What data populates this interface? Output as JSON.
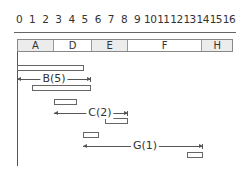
{
  "axis": {
    "ticks": [
      "0",
      "1",
      "2",
      "3",
      "4",
      "5",
      "6",
      "7",
      "8",
      "9",
      "10",
      "11",
      "12",
      "13",
      "14",
      "15",
      "16"
    ]
  },
  "header": {
    "cells": [
      {
        "label": "A",
        "x": 17,
        "w": 36,
        "shaded": true
      },
      {
        "label": "D",
        "x": 53,
        "w": 39,
        "shaded": false
      },
      {
        "label": "E",
        "x": 92,
        "w": 36,
        "shaded": true
      },
      {
        "label": "F",
        "x": 128,
        "w": 75,
        "shaded": false
      },
      {
        "label": "H",
        "x": 203,
        "w": 30,
        "shaded": true
      }
    ]
  },
  "bars": [
    {
      "x": 17,
      "y": 65,
      "w": 67
    },
    {
      "x": 32,
      "y": 85,
      "w": 59
    },
    {
      "x": 54,
      "y": 99,
      "w": 23
    },
    {
      "x": 105,
      "y": 118,
      "w": 23
    },
    {
      "x": 83,
      "y": 132,
      "w": 16
    },
    {
      "x": 187,
      "y": 152,
      "w": 16
    }
  ],
  "arrows": [
    {
      "label": "B(5)",
      "x1": 17,
      "x2": 91,
      "y": 74,
      "label_x": 37
    },
    {
      "label": "C(2)",
      "x1": 54,
      "x2": 128,
      "y": 108,
      "label_x": 46
    },
    {
      "label": "G(1)",
      "x1": 83,
      "x2": 203,
      "y": 141,
      "label_x": 62
    }
  ]
}
